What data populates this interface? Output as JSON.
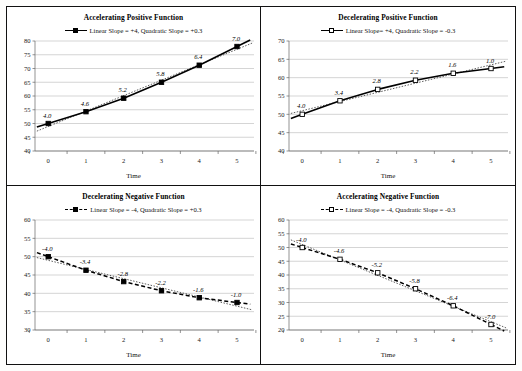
{
  "figure": {
    "background_color": "#ffffff",
    "border_color": "#111111",
    "series_color": "#000000",
    "grid_color": "#b8b8b8"
  },
  "chart_data": [
    {
      "type": "line",
      "panel": "top-left",
      "title": "Accelerating Positive Function",
      "legend": "Linear Slope = +4, Quadratic Slope = +0.3",
      "legend_position": "top-center",
      "legend_marker": "filled-square",
      "legend_line": "solid",
      "xlabel": "Time",
      "ylabel": "",
      "x": [
        0,
        1,
        2,
        3,
        4,
        5
      ],
      "xticks": [
        "0",
        "1",
        "2",
        "3",
        "4",
        "5"
      ],
      "xlim": [
        -0.35,
        5.45
      ],
      "values": [
        50.0,
        54.3,
        59.2,
        65.0,
        71.2,
        78.0
      ],
      "point_labels": [
        "4.0",
        "4.6",
        "5.2",
        "5.8",
        "6.4",
        "7.0"
      ],
      "yticks": [
        "40",
        "45",
        "50",
        "55",
        "60",
        "65",
        "70",
        "75",
        "80"
      ],
      "ylim": [
        40,
        80
      ],
      "grid": true,
      "trend": "linear-dashed-overlay"
    },
    {
      "type": "line",
      "panel": "top-right",
      "title": "Decelerating Positive Function",
      "legend": "Linear Slope= +4, Quadratic Slope = -0.3",
      "legend_position": "top-center",
      "legend_marker": "open-square",
      "legend_line": "solid",
      "xlabel": "Time",
      "ylabel": "",
      "x": [
        0,
        1,
        2,
        3,
        4,
        5
      ],
      "xticks": [
        "0",
        "1",
        "2",
        "3",
        "4",
        "5"
      ],
      "xlim": [
        -0.35,
        5.45
      ],
      "values": [
        50.0,
        53.7,
        56.8,
        59.3,
        61.2,
        62.5
      ],
      "point_labels": [
        "4.0",
        "3.4",
        "2.8",
        "2.2",
        "1.6",
        "1.0"
      ],
      "yticks": [
        "40",
        "45",
        "50",
        "55",
        "60",
        "65",
        "70"
      ],
      "ylim": [
        40,
        70
      ],
      "grid": true,
      "trend": "linear-dashed-overlay"
    },
    {
      "type": "line",
      "panel": "bottom-left",
      "title": "Decelerating Negative Function",
      "legend": "Linear Slope = -4, Quadratic Slope = +0.3",
      "legend_position": "top-center",
      "legend_marker": "filled-square",
      "legend_line": "dashed",
      "xlabel": "Time",
      "ylabel": "",
      "x": [
        0,
        1,
        2,
        3,
        4,
        5
      ],
      "xticks": [
        "0",
        "1",
        "2",
        "3",
        "4",
        "5"
      ],
      "xlim": [
        -0.35,
        5.45
      ],
      "values": [
        50.0,
        46.3,
        43.2,
        40.7,
        38.8,
        37.5
      ],
      "point_labels": [
        "-4.0",
        "-3.4",
        "-2.8",
        "-2.2",
        "-1.6",
        "-1.0"
      ],
      "yticks": [
        "30",
        "35",
        "40",
        "45",
        "50",
        "55",
        "60"
      ],
      "ylim": [
        30,
        60
      ],
      "grid": true,
      "trend": "linear-dashed-overlay"
    },
    {
      "type": "line",
      "panel": "bottom-right",
      "title": "Accelerating Negative Function",
      "legend": "Linear Slope = -4, Quadratic Slope = -0.3",
      "legend_position": "top-center",
      "legend_marker": "open-square",
      "legend_line": "dashed",
      "xlabel": "Time",
      "ylabel": "",
      "x": [
        0,
        1,
        2,
        3,
        4,
        5
      ],
      "xticks": [
        "0",
        "1",
        "2",
        "3",
        "4",
        "5"
      ],
      "xlim": [
        -0.35,
        5.45
      ],
      "values": [
        50.0,
        45.7,
        40.8,
        35.0,
        28.8,
        22.0
      ],
      "point_labels": [
        "-4.0",
        "-4.6",
        "-5.2",
        "-5.8",
        "-6.4",
        "-7.0"
      ],
      "yticks": [
        "20",
        "25",
        "30",
        "35",
        "40",
        "45",
        "50",
        "55",
        "60"
      ],
      "ylim": [
        20,
        60
      ],
      "grid": true,
      "trend": "linear-dashed-overlay"
    }
  ]
}
